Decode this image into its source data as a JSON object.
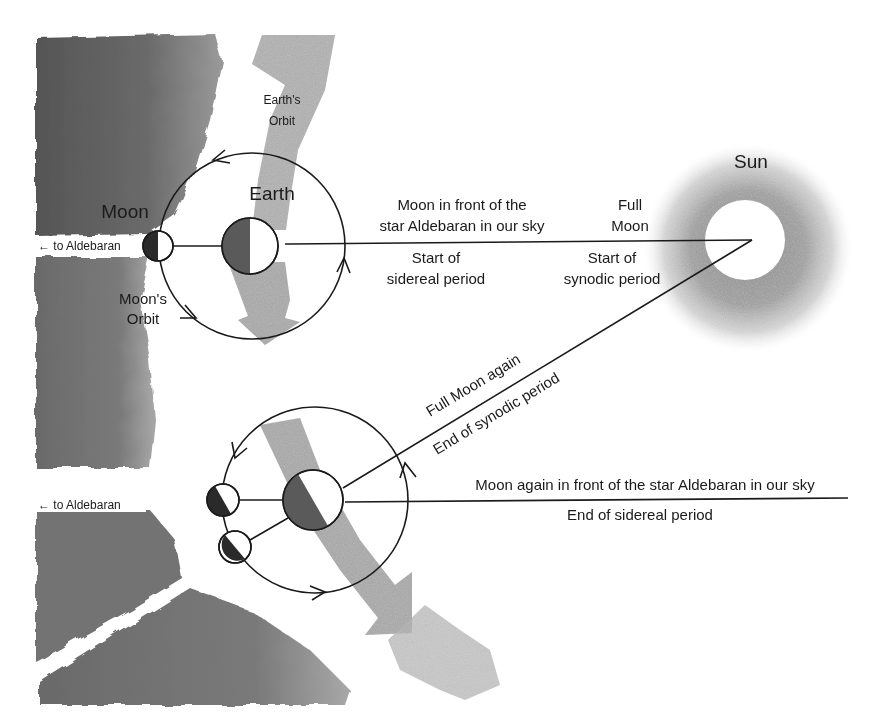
{
  "diagram": {
    "colors": {
      "background": "#ffffff",
      "sky_wash": "#6e6e6e",
      "orbit_band": "#9a9a9a",
      "line": "#1a1a1a",
      "shadow_dark": "#2a2a2a",
      "earth_shadow": "#5a5a5a",
      "sun_glow": "#9c9c9c"
    },
    "labels": {
      "earths_orbit": [
        "Earth's",
        "Orbit"
      ],
      "earth": "Earth",
      "moon": "Moon",
      "moons_orbit": [
        "Moon's",
        "Orbit"
      ],
      "sun": "Sun",
      "to_aldebaran_top": "← to Aldebaran",
      "to_aldebaran_bottom": "← to Aldebaran",
      "moon_in_front": [
        "Moon in front of the",
        "star Aldebaran in our sky"
      ],
      "start_sidereal": [
        "Start of",
        "sidereal period"
      ],
      "full_moon": [
        "Full",
        "Moon"
      ],
      "start_synodic": [
        "Start of",
        "synodic period"
      ],
      "full_moon_again": "Full Moon again",
      "end_synodic": "End of synodic period",
      "moon_again_in_front": "Moon again in front of the star Aldebaran in our sky",
      "end_sidereal": "End of sidereal period"
    },
    "positions": {
      "first": {
        "earth": {
          "cx": 250,
          "cy": 246,
          "r": 28
        },
        "moon_orbit": {
          "cx": 252,
          "cy": 246,
          "r": 93
        },
        "moon": {
          "cx": 158,
          "cy": 246,
          "r": 15
        }
      },
      "second": {
        "earth": {
          "cx": 313,
          "cy": 500,
          "r": 30
        },
        "moon_orbit": {
          "cx": 315,
          "cy": 500,
          "r": 93
        },
        "moon_sidereal": {
          "cx": 223,
          "cy": 500,
          "r": 16
        },
        "moon_synodic": {
          "cx": 235,
          "cy": 547,
          "r": 16
        }
      },
      "sun": {
        "cx": 745,
        "cy": 240,
        "r": 40
      }
    }
  }
}
